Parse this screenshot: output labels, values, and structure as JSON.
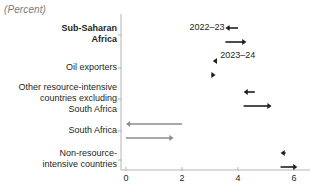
{
  "chart": {
    "unit_title": "(Percent)",
    "type": "arrow-range",
    "xlabel": "",
    "ylabel": "",
    "xlim": [
      -0.6,
      6.5
    ],
    "xticks": [
      0,
      2,
      4,
      6
    ],
    "xtick_labels": [
      "0",
      "2",
      "4",
      "6"
    ],
    "grid": false,
    "legend_position": "inline-annotation",
    "annotations": [
      {
        "name": "series-label-2022-23",
        "text": "2022–23",
        "x": 3.05,
        "y_px": 22
      },
      {
        "name": "series-label-2023-24",
        "text": "2023–24",
        "x": 4.15,
        "y_px": 50
      }
    ],
    "series_names": [
      "2022–23",
      "2023–24"
    ],
    "colors": {
      "dark": "#231f20",
      "gray": "#8d8d8d",
      "axis": "#b5b5b5",
      "title": "#7b7b7b"
    },
    "categories": [
      {
        "label": "Sub-Saharan\nAfrica",
        "bold": true,
        "color": "dark",
        "arrows": [
          {
            "series": "2022–23",
            "start": 4.0,
            "end": 3.55,
            "direction": "left"
          },
          {
            "series": "2023–24",
            "start": 3.55,
            "end": 4.3,
            "direction": "right"
          }
        ]
      },
      {
        "label": "Oil exporters",
        "bold": false,
        "color": "dark",
        "arrows": [
          {
            "series": "2022–23",
            "start": 3.25,
            "end": 3.1,
            "direction": "left"
          },
          {
            "series": "2023–24",
            "start": 3.05,
            "end": 3.2,
            "direction": "right"
          }
        ]
      },
      {
        "label": "Other resource-intensive\ncountries excluding\nSouth Africa",
        "bold": false,
        "color": "dark",
        "arrows": [
          {
            "series": "2022–23",
            "start": 4.6,
            "end": 4.2,
            "direction": "left"
          },
          {
            "series": "2023–24",
            "start": 4.2,
            "end": 5.2,
            "direction": "right"
          }
        ]
      },
      {
        "label": "South Africa",
        "bold": false,
        "color": "gray",
        "arrows": [
          {
            "series": "2022–23",
            "start": 2.0,
            "end": 0.0,
            "direction": "left"
          },
          {
            "series": "2023–24",
            "start": 0.0,
            "end": 1.7,
            "direction": "right"
          }
        ]
      },
      {
        "label": "Non-resource-\nintensive countries",
        "bold": false,
        "color": "dark",
        "arrows": [
          {
            "series": "2022–23",
            "start": 5.7,
            "end": 5.52,
            "direction": "left"
          },
          {
            "series": "2023–24",
            "start": 5.52,
            "end": 6.12,
            "direction": "right"
          }
        ]
      }
    ]
  },
  "chart_data": {
    "type": "bar",
    "title": "(Percent)",
    "xlabel": "",
    "ylabel": "",
    "xlim": [
      -0.6,
      6.5
    ],
    "ylim": [
      0,
      5
    ],
    "grid": false,
    "legend_position": "inline-annotation",
    "categories": [
      "Sub-Saharan Africa",
      "Oil exporters",
      "Other resource-intensive countries excluding South Africa",
      "South Africa",
      "Non-resource-intensive countries"
    ],
    "series": [
      {
        "name": "2022–23",
        "description": "arrow from previous value to 2022–23 value",
        "from": [
          4.0,
          3.25,
          4.6,
          2.0,
          5.7
        ],
        "values": [
          3.55,
          3.1,
          4.2,
          0.0,
          5.52
        ]
      },
      {
        "name": "2023–24",
        "description": "arrow from 2022–23 value to 2023–24 value",
        "from": [
          3.55,
          3.05,
          4.2,
          0.0,
          5.52
        ],
        "values": [
          4.3,
          3.2,
          5.2,
          1.7,
          6.12
        ]
      }
    ],
    "xticks": [
      0,
      2,
      4,
      6
    ],
    "xtick_labels": [
      "0",
      "2",
      "4",
      "6"
    ]
  }
}
